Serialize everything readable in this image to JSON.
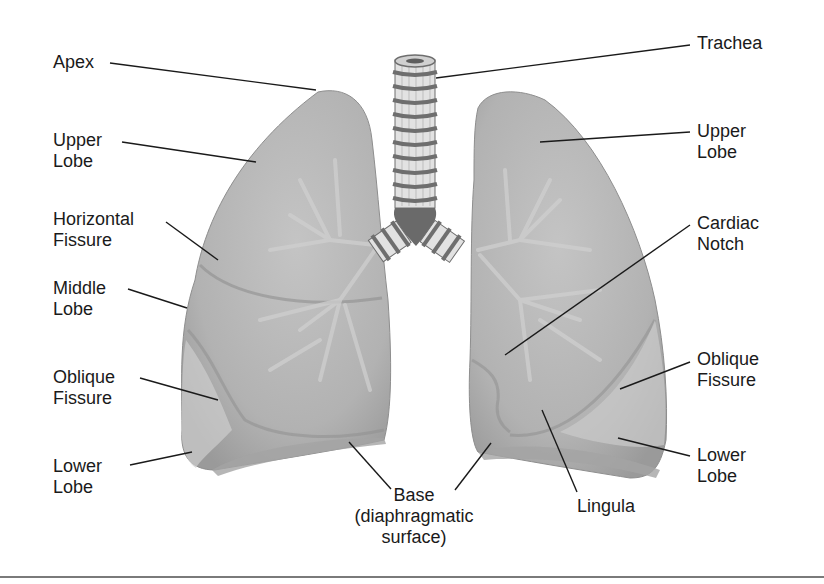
{
  "figure": {
    "colors": {
      "lung_fill": "#b9b9b9",
      "lung_shadow": "#9c9c9c",
      "lung_highlight": "#d6d6d6",
      "bronchi": "#cfcfcf",
      "trachea_ring": "#6e6e6e",
      "trachea_fill": "#e2e2e2",
      "leader_line": "#1a1a1a",
      "text": "#1a1a1a",
      "bottom_rule": "#7a7a7a"
    },
    "labels_left": [
      {
        "id": "apex",
        "line1": "Apex",
        "line2": ""
      },
      {
        "id": "upper-lobe-right",
        "line1": "Upper",
        "line2": "Lobe"
      },
      {
        "id": "horizontal-fissure",
        "line1": "Horizontal",
        "line2": "Fissure"
      },
      {
        "id": "middle-lobe",
        "line1": "Middle",
        "line2": "Lobe"
      },
      {
        "id": "oblique-fissure-right",
        "line1": "Oblique",
        "line2": "Fissure"
      },
      {
        "id": "lower-lobe-right",
        "line1": "Lower",
        "line2": "Lobe"
      }
    ],
    "labels_right": [
      {
        "id": "trachea",
        "line1": "Trachea",
        "line2": ""
      },
      {
        "id": "upper-lobe-left",
        "line1": "Upper",
        "line2": "Lobe"
      },
      {
        "id": "cardiac-notch",
        "line1": "Cardiac",
        "line2": "Notch"
      },
      {
        "id": "oblique-fissure-left",
        "line1": "Oblique",
        "line2": "Fissure"
      },
      {
        "id": "lower-lobe-left",
        "line1": "Lower",
        "line2": "Lobe"
      }
    ],
    "labels_bottom": [
      {
        "id": "base",
        "line1": "Base",
        "line2": "(diaphragmatic",
        "line3": "surface)"
      },
      {
        "id": "lingula",
        "line1": "Lingula"
      }
    ]
  }
}
